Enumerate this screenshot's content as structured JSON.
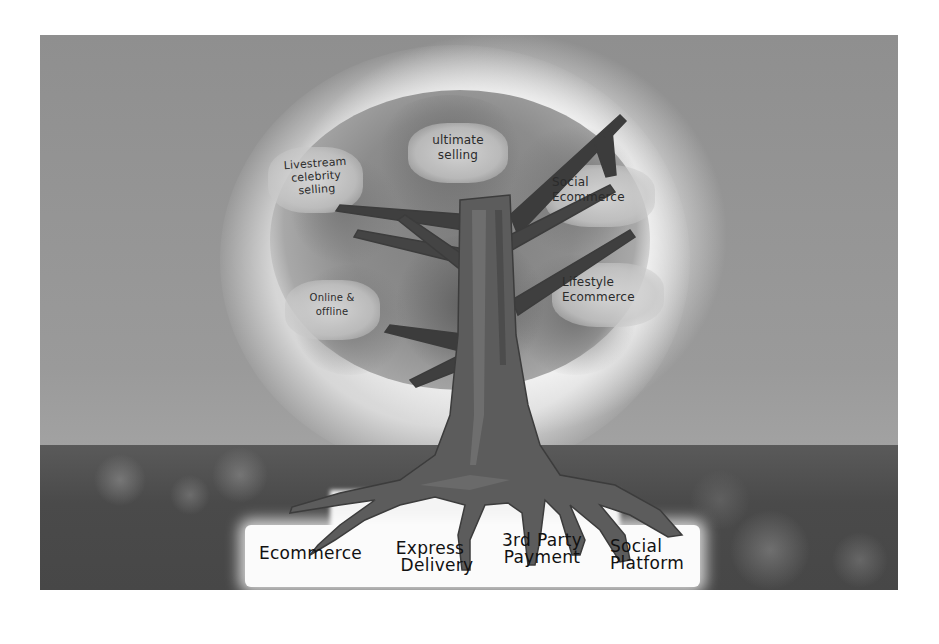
{
  "illustration": {
    "description": "Hand-painted grayscale tree illustration: roots labeled with foundations, canopy labeled with growth areas",
    "canopy_labels": [
      {
        "id": "livestream",
        "lines": [
          "Livestream",
          "celebrity",
          "selling"
        ]
      },
      {
        "id": "ultimate",
        "lines": [
          "ultimate",
          "selling"
        ]
      },
      {
        "id": "social-ecommerce",
        "lines": [
          "Social",
          "Ecommerce"
        ]
      },
      {
        "id": "lifestyle",
        "lines": [
          "Lifestyle",
          "Ecommerce"
        ]
      },
      {
        "id": "online-offline",
        "lines": [
          "Online &",
          "offline"
        ]
      }
    ],
    "root_labels": [
      {
        "id": "ecommerce",
        "lines": [
          "Ecommerce"
        ]
      },
      {
        "id": "express-delivery",
        "lines": [
          "Express",
          "Delivery"
        ]
      },
      {
        "id": "third-party-payment",
        "lines": [
          "3rd Party",
          "Payment"
        ]
      },
      {
        "id": "social-platform",
        "lines": [
          "Social",
          "Platform"
        ]
      }
    ],
    "colors": {
      "page_background": "#ffffff",
      "sky": "#939393",
      "glow": "#f4f4f4",
      "canopy": "#8c8c8c",
      "trunk": "#5e5e5e",
      "ground": "#4a4a4a",
      "ground_band": "#fbfbfb",
      "ink": "#111111"
    }
  }
}
